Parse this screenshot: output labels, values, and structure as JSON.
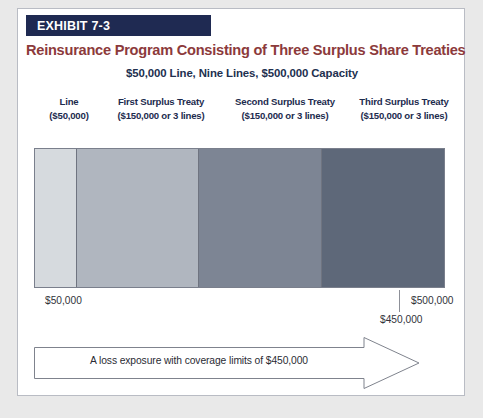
{
  "exhibit": {
    "banner_label": "EXHIBIT 7-3",
    "banner_color": "#1f2a52",
    "title": "Reinsurance Program Consisting of Three Surplus Share Treaties",
    "title_color": "#8c3a3b",
    "subtitle": "$50,000 Line, Nine Lines, $500,000 Capacity",
    "subtitle_color": "#22304f"
  },
  "columns": [
    {
      "name": "Line",
      "detail": "($50,000)"
    },
    {
      "name": "First Surplus Treaty",
      "detail": "($150,000 or 3 lines)"
    },
    {
      "name": "Second Surplus Treaty",
      "detail": "($150,000 or 3 lines)"
    },
    {
      "name": "Third Surplus Treaty",
      "detail": "($150,000 or 3 lines)"
    }
  ],
  "axis": {
    "min_label": "$50,000",
    "max_label": "$500,000",
    "mid_label": "$450,000"
  },
  "arrow": {
    "label": "A loss exposure with coverage limits of $450,000"
  },
  "chart_data": {
    "type": "bar",
    "orientation": "horizontal-stacked",
    "title": "Reinsurance Program Consisting of Three Surplus Share Treaties",
    "subtitle": "$50,000 Line, Nine Lines, $500,000 Capacity",
    "xlabel": "",
    "ylabel": "",
    "xlim": [
      0,
      500000
    ],
    "grid": false,
    "legend": "none",
    "categories": [
      "Line",
      "First Surplus Treaty",
      "Second Surplus Treaty",
      "Third Surplus Treaty"
    ],
    "values": [
      50000,
      150000,
      150000,
      150000
    ],
    "value_labels": [
      "($50,000)",
      "($150,000 or 3 lines)",
      "($150,000 or 3 lines)",
      "($150,000 or 3 lines)"
    ],
    "colors": [
      "#d6dade",
      "#b0b6bf",
      "#7d8594",
      "#5e6879"
    ],
    "tick_labels": [
      "$50,000",
      "$450,000",
      "$500,000"
    ],
    "tick_values": [
      50000,
      450000,
      500000
    ],
    "annotations": [
      {
        "text": "A loss exposure with coverage limits of $450,000",
        "value": 450000,
        "shape": "arrow"
      }
    ]
  }
}
